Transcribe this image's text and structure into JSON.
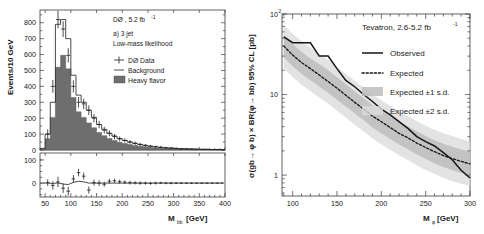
{
  "figure": {
    "name": "Higgs search limit figure",
    "panels": 2
  },
  "left": {
    "annotations": {
      "experiment": "DØ , 5.2 fb",
      "experiment_sup": "-1",
      "label_a": "a) 3 jet",
      "label_b": "Low-mass likelihood"
    },
    "legend": [
      {
        "label": "DØ  Data",
        "marker": "errorbar-cross"
      },
      {
        "label": "Background",
        "marker": "line"
      },
      {
        "label": "Heavy flavor",
        "marker": "filled-box"
      }
    ],
    "axes": {
      "ylabel": "Events/10 GeV",
      "xlabel_main": "M",
      "xlabel_sub": "bb",
      "xlabel_unit": " [GeV]",
      "xticks": [
        50,
        100,
        150,
        200,
        250,
        300,
        350,
        400
      ],
      "yticks": [
        0,
        100,
        200,
        300,
        400,
        500,
        600,
        700,
        800
      ],
      "ylim": [
        0,
        880
      ],
      "xlim": [
        40,
        400
      ],
      "resid_yticks": [
        0,
        100
      ],
      "resid_ylim": [
        -60,
        130
      ]
    },
    "chart_data": {
      "type": "bar",
      "title": "DØ , 5.2 fb-1  a) 3 jet Low-mass likelihood",
      "xlabel": "M_bb [GeV]",
      "ylabel": "Events/10 GeV",
      "xlim": [
        40,
        400
      ],
      "ylim": [
        0,
        880
      ],
      "bin_width": 10,
      "bin_centers": [
        45,
        55,
        65,
        75,
        85,
        95,
        105,
        115,
        125,
        135,
        145,
        155,
        165,
        175,
        185,
        195,
        205,
        215,
        225,
        235,
        245,
        255,
        265,
        275,
        285,
        295,
        305,
        315,
        325,
        335,
        345,
        355,
        365,
        375,
        385,
        395
      ],
      "series": [
        {
          "name": "Background",
          "type": "step-line",
          "values": [
            10,
            100,
            300,
            790,
            820,
            700,
            470,
            345,
            300,
            250,
            205,
            160,
            130,
            105,
            88,
            72,
            60,
            50,
            42,
            35,
            29,
            24,
            20,
            17,
            14,
            12,
            10,
            8,
            7,
            6,
            5,
            4,
            4,
            3,
            3,
            2
          ]
        },
        {
          "name": "Heavy flavor",
          "type": "filled-histogram",
          "values": [
            6,
            70,
            205,
            520,
            595,
            510,
            330,
            240,
            205,
            170,
            140,
            110,
            90,
            72,
            60,
            49,
            41,
            34,
            28,
            24,
            20,
            16,
            13,
            11,
            9,
            8,
            7,
            6,
            5,
            4,
            3,
            3,
            3,
            2,
            2,
            2
          ]
        },
        {
          "name": "DØ Data",
          "type": "points",
          "values": [
            null,
            100,
            400,
            820,
            760,
            595,
            400,
            300,
            290,
            250,
            200,
            160,
            125,
            105,
            85,
            70,
            60,
            50,
            42,
            35,
            29,
            24,
            20,
            17,
            14,
            12,
            10,
            8,
            7,
            6,
            5,
            4,
            4,
            3,
            3,
            2
          ],
          "errors": [
            null,
            30,
            40,
            55,
            50,
            45,
            38,
            33,
            32,
            30,
            26,
            23,
            21,
            19,
            17,
            15,
            14,
            12,
            11,
            10,
            9,
            8,
            7,
            7,
            6,
            6,
            5,
            5,
            4,
            4,
            4,
            3,
            3,
            3,
            3,
            2
          ]
        }
      ],
      "residual": {
        "name": "Data - Background",
        "values": [
          null,
          2,
          -10,
          5,
          -22,
          -35,
          18,
          45,
          30,
          -30,
          2,
          0,
          -5,
          8,
          10,
          6,
          4,
          2,
          1,
          0,
          0,
          -1,
          0,
          1,
          0,
          0,
          0,
          0,
          0,
          0,
          0,
          0,
          0,
          0,
          0,
          0
        ],
        "errors": [
          null,
          14,
          18,
          22,
          20,
          19,
          17,
          16,
          15,
          15,
          13,
          12,
          11,
          10,
          9,
          9,
          8,
          8,
          7,
          7,
          6,
          6,
          6,
          5,
          5,
          5,
          4,
          4,
          4,
          4,
          3,
          3,
          3,
          3,
          3,
          3
        ]
      }
    }
  },
  "right": {
    "annotations": {
      "title": "Tevatron, 2.6-5.2 fb",
      "title_sup": "-1"
    },
    "legend": [
      {
        "label": "Observed",
        "marker": "solid-line"
      },
      {
        "label": "Expected",
        "marker": "dotted-line"
      },
      {
        "label": "Expected ±1 s.d.",
        "marker": "band-1sd"
      },
      {
        "label": "Expected ±2 s.d.",
        "marker": "band-2sd"
      }
    ],
    "axes": {
      "ylabel": "σ(gb→ φ b) × BR(φ→ bb) 95% CL [pb]",
      "xlabel_main": "M",
      "xlabel_sub": "φ",
      "xlabel_unit": " [GeV]",
      "xticks": [
        100,
        150,
        200,
        250,
        300
      ],
      "yticks": [
        "1",
        "10",
        "10"
      ],
      "ytick_sup": "2",
      "yscale": "log",
      "ylim": [
        0.55,
        100
      ],
      "xlim": [
        88,
        300
      ]
    },
    "chart_data": {
      "type": "line",
      "title": "Tevatron, 2.6-5.2 fb-1",
      "xlabel": "M_phi [GeV]",
      "ylabel": "sigma(gb->phi b) x BR(phi->bb) 95% CL [pb]",
      "yscale": "log",
      "xlim": [
        88,
        300
      ],
      "ylim": [
        0.55,
        100
      ],
      "x": [
        90,
        100,
        110,
        120,
        130,
        140,
        150,
        160,
        170,
        180,
        190,
        200,
        210,
        220,
        230,
        240,
        250,
        260,
        270,
        280,
        290,
        300
      ],
      "series": [
        {
          "name": "Observed",
          "style": "solid",
          "values": [
            52,
            44,
            44,
            44,
            30,
            30,
            21,
            15,
            12.5,
            10,
            8.2,
            6.6,
            5.6,
            4.6,
            3.8,
            3.0,
            2.6,
            2.3,
            1.9,
            1.55,
            1.15,
            0.92
          ]
        },
        {
          "name": "Expected",
          "style": "dotted",
          "values": [
            40,
            31,
            25,
            21,
            17.5,
            14.5,
            12,
            9.8,
            8.0,
            6.6,
            5.4,
            4.6,
            3.9,
            3.3,
            2.9,
            2.5,
            2.2,
            1.95,
            1.75,
            1.6,
            1.48,
            1.38
          ]
        },
        {
          "name": "Expected +1 s.d.",
          "style": "band",
          "values": [
            55,
            42,
            34,
            28,
            24,
            20,
            16.5,
            13.5,
            11,
            9.0,
            7.4,
            6.3,
            5.4,
            4.6,
            4.0,
            3.5,
            3.05,
            2.7,
            2.45,
            2.25,
            2.08,
            1.95
          ]
        },
        {
          "name": "Expected -1 s.d.",
          "style": "band",
          "values": [
            29,
            22.5,
            18,
            15,
            12.6,
            10.5,
            8.6,
            7.1,
            5.8,
            4.8,
            3.9,
            3.3,
            2.8,
            2.4,
            2.1,
            1.8,
            1.58,
            1.4,
            1.26,
            1.15,
            1.06,
            0.99
          ]
        },
        {
          "name": "Expected +2 s.d.",
          "style": "band",
          "values": [
            74,
            57,
            46,
            38,
            32,
            27,
            22,
            18,
            14.8,
            12.2,
            10,
            8.5,
            7.2,
            6.2,
            5.4,
            4.7,
            4.1,
            3.65,
            3.3,
            3.05,
            2.8,
            2.62
          ]
        },
        {
          "name": "Expected -2 s.d.",
          "style": "band",
          "values": [
            21,
            16.5,
            13.2,
            11,
            9.2,
            7.7,
            6.3,
            5.2,
            4.2,
            3.5,
            2.85,
            2.42,
            2.06,
            1.76,
            1.54,
            1.32,
            1.16,
            1.03,
            0.92,
            0.84,
            0.78,
            0.73
          ]
        }
      ]
    }
  }
}
